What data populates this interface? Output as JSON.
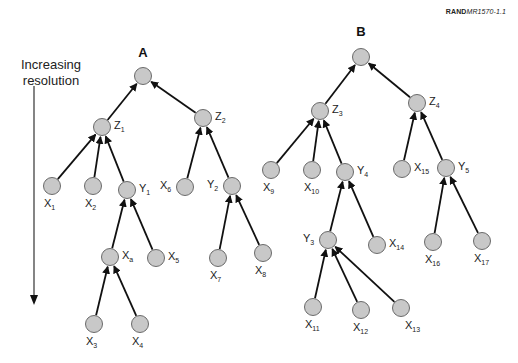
{
  "figure": {
    "reference": {
      "bold": "RAND",
      "italic": "MR1570-1.1"
    },
    "axis": {
      "label_line1": "Increasing",
      "label_line2": "resolution",
      "x": 34,
      "y_start": 86,
      "y_end": 305
    },
    "colors": {
      "node_fill": "#c8c8c8",
      "node_stroke": "#6a6a6a",
      "edge": "#111111",
      "text": "#222222"
    },
    "trees": [
      {
        "title": "A",
        "title_pos": [
          143,
          52
        ],
        "nodes": [
          {
            "id": "A",
            "base": "",
            "sub": "",
            "x": 143,
            "y": 76,
            "label_side": "none"
          },
          {
            "id": "Z1",
            "base": "Z",
            "sub": "1",
            "x": 102,
            "y": 127,
            "label_side": "right"
          },
          {
            "id": "Z2",
            "base": "Z",
            "sub": "2",
            "x": 203,
            "y": 118,
            "label_side": "right"
          },
          {
            "id": "X1",
            "base": "X",
            "sub": "1",
            "x": 52,
            "y": 186,
            "label_side": "below"
          },
          {
            "id": "X2",
            "base": "X",
            "sub": "2",
            "x": 93,
            "y": 186,
            "label_side": "below"
          },
          {
            "id": "Y1",
            "base": "Y",
            "sub": "1",
            "x": 127,
            "y": 190,
            "label_side": "right"
          },
          {
            "id": "X6",
            "base": "X",
            "sub": "6",
            "x": 185,
            "y": 187,
            "label_side": "left"
          },
          {
            "id": "Y2",
            "base": "Y",
            "sub": "2",
            "x": 232,
            "y": 186,
            "label_side": "left"
          },
          {
            "id": "Xa",
            "base": "X",
            "sub": "a",
            "x": 110,
            "y": 257,
            "label_side": "right"
          },
          {
            "id": "X5",
            "base": "X",
            "sub": "5",
            "x": 156,
            "y": 258,
            "label_side": "right"
          },
          {
            "id": "X7",
            "base": "X",
            "sub": "7",
            "x": 218,
            "y": 258,
            "label_side": "below"
          },
          {
            "id": "X8",
            "base": "X",
            "sub": "8",
            "x": 263,
            "y": 253,
            "label_side": "below"
          },
          {
            "id": "X3",
            "base": "X",
            "sub": "3",
            "x": 94,
            "y": 324,
            "label_side": "below"
          },
          {
            "id": "X4",
            "base": "X",
            "sub": "4",
            "x": 140,
            "y": 324,
            "label_side": "below"
          }
        ],
        "edges": [
          [
            "Z1",
            "A"
          ],
          [
            "Z2",
            "A"
          ],
          [
            "X1",
            "Z1"
          ],
          [
            "X2",
            "Z1"
          ],
          [
            "Y1",
            "Z1"
          ],
          [
            "X6",
            "Z2"
          ],
          [
            "Y2",
            "Z2"
          ],
          [
            "Xa",
            "Y1"
          ],
          [
            "X5",
            "Y1"
          ],
          [
            "X7",
            "Y2"
          ],
          [
            "X8",
            "Y2"
          ],
          [
            "X3",
            "Xa"
          ],
          [
            "X4",
            "Xa"
          ]
        ]
      },
      {
        "title": "B",
        "title_pos": [
          361,
          31
        ],
        "nodes": [
          {
            "id": "B",
            "base": "",
            "sub": "",
            "x": 361,
            "y": 57,
            "label_side": "none"
          },
          {
            "id": "Z3",
            "base": "Z",
            "sub": "3",
            "x": 320,
            "y": 111,
            "label_side": "right"
          },
          {
            "id": "Z4",
            "base": "Z",
            "sub": "4",
            "x": 417,
            "y": 103,
            "label_side": "right"
          },
          {
            "id": "X9",
            "base": "X",
            "sub": "9",
            "x": 271,
            "y": 170,
            "label_side": "below"
          },
          {
            "id": "X10",
            "base": "X",
            "sub": "10",
            "x": 312,
            "y": 170,
            "label_side": "below"
          },
          {
            "id": "Y4",
            "base": "Y",
            "sub": "4",
            "x": 345,
            "y": 172,
            "label_side": "right"
          },
          {
            "id": "X15",
            "base": "X",
            "sub": "15",
            "x": 402,
            "y": 169,
            "label_side": "right"
          },
          {
            "id": "Y5",
            "base": "Y",
            "sub": "5",
            "x": 446,
            "y": 168,
            "label_side": "right"
          },
          {
            "id": "Y3",
            "base": "Y",
            "sub": "3",
            "x": 328,
            "y": 240,
            "label_side": "left"
          },
          {
            "id": "X14",
            "base": "X",
            "sub": "14",
            "x": 377,
            "y": 245,
            "label_side": "right"
          },
          {
            "id": "X16",
            "base": "X",
            "sub": "16",
            "x": 433,
            "y": 242,
            "label_side": "below"
          },
          {
            "id": "X17",
            "base": "X",
            "sub": "17",
            "x": 482,
            "y": 241,
            "label_side": "below"
          },
          {
            "id": "X11",
            "base": "X",
            "sub": "11",
            "x": 313,
            "y": 307,
            "label_side": "below"
          },
          {
            "id": "X12",
            "base": "X",
            "sub": "12",
            "x": 361,
            "y": 310,
            "label_side": "below"
          },
          {
            "id": "X13",
            "base": "X",
            "sub": "13",
            "x": 401,
            "y": 308,
            "label_side": "belowright"
          }
        ],
        "edges": [
          [
            "Z3",
            "B"
          ],
          [
            "Z4",
            "B"
          ],
          [
            "X9",
            "Z3"
          ],
          [
            "X10",
            "Z3"
          ],
          [
            "Y4",
            "Z3"
          ],
          [
            "X15",
            "Z4"
          ],
          [
            "Y5",
            "Z4"
          ],
          [
            "Y3",
            "Y4"
          ],
          [
            "X14",
            "Y4"
          ],
          [
            "X16",
            "Y5"
          ],
          [
            "X17",
            "Y5"
          ],
          [
            "X11",
            "Y3"
          ],
          [
            "X12",
            "Y3"
          ],
          [
            "X13",
            "Y3"
          ]
        ]
      }
    ]
  }
}
